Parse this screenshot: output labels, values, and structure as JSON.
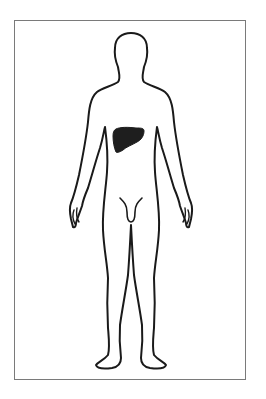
{
  "diagram": {
    "type": "anatomical-body-outline",
    "view": "front",
    "highlighted_organ": "liver",
    "colors": {
      "background": "#ffffff",
      "frame_border": "#7a7a7a",
      "outline": "#1a1a1a",
      "organ_fill": "#1e1e1e"
    }
  }
}
